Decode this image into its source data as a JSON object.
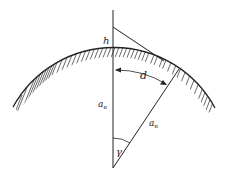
{
  "diagram": {
    "title": "",
    "labels": {
      "height": "h",
      "distance": "d",
      "radius_symbol": "a",
      "radius_subscript": "e",
      "angle": "γ"
    },
    "colors": {
      "line": "#222222",
      "hatch": "#444444",
      "background": "#ffffff"
    }
  }
}
